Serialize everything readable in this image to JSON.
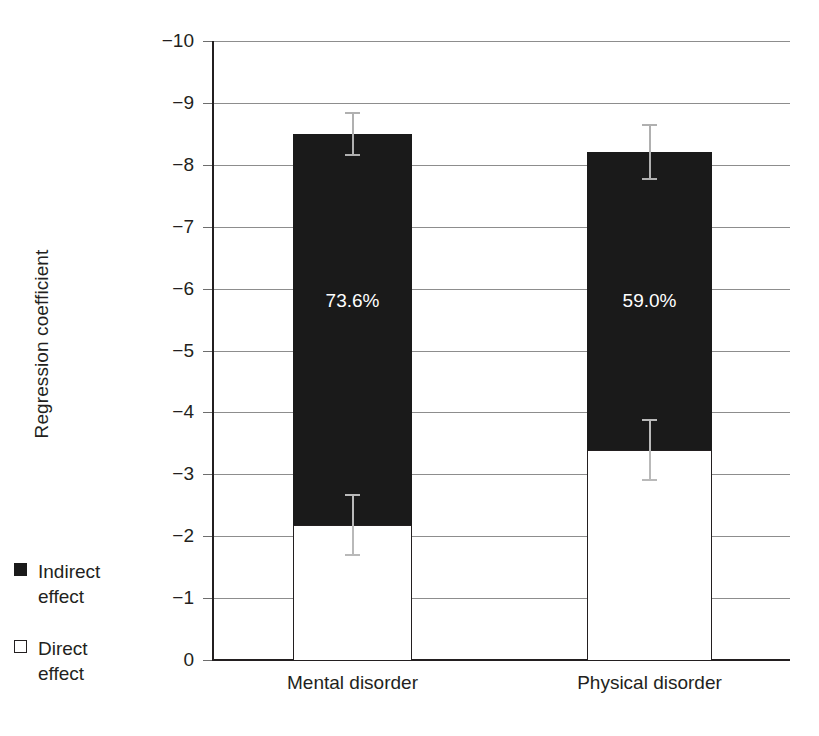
{
  "chart_data": {
    "type": "bar",
    "subtype": "stacked-bar-with-error-bars",
    "title": "",
    "xlabel": "",
    "ylabel": "Regression coefficient",
    "categories": [
      "Mental disorder",
      "Physical disorder"
    ],
    "ylim": [
      -10,
      0
    ],
    "y_tick_labels": [
      "−10",
      "−9",
      "−8",
      "−7",
      "−6",
      "−5",
      "−4",
      "−3",
      "−2",
      "−1",
      "0"
    ],
    "y_ticks": [
      -10,
      -9,
      -8,
      -7,
      -6,
      -5,
      -4,
      -3,
      -2,
      -1,
      0
    ],
    "grid": true,
    "grid_axis": "y",
    "legend_position": "left-outside",
    "series": [
      {
        "name": "Direct effect",
        "color": "#ffffff",
        "values": [
          -2.18,
          -3.39
        ],
        "error": [
          0.5,
          0.5
        ]
      },
      {
        "name": "Indirect effect",
        "color": "#1a1a1a",
        "values": [
          -6.32,
          -4.82
        ],
        "error": [
          0.0,
          0.0
        ]
      }
    ],
    "totals": [
      -8.5,
      -8.21
    ],
    "total_error": [
      0.35,
      0.45
    ],
    "data_labels": [
      "73.6%",
      "59.0%"
    ],
    "annotations": [
      {
        "text": "73.6%",
        "category": "Mental disorder",
        "meaning": "share of total effect that is indirect"
      },
      {
        "text": "59.0%",
        "category": "Physical disorder",
        "meaning": "share of total effect that is indirect"
      }
    ]
  },
  "axis": {
    "y_title": "Regression coefficient",
    "y_tick_labels": [
      "−10",
      "−9",
      "−8",
      "−7",
      "−6",
      "−5",
      "−4",
      "−3",
      "−2",
      "−1",
      "0"
    ]
  },
  "legend": {
    "items": [
      {
        "label_line1": "Indirect",
        "label_line2": "effect",
        "swatch": "filled-square",
        "color": "#1a1a1a"
      },
      {
        "label_line1": "Direct",
        "label_line2": "effect",
        "swatch": "hollow-square",
        "color": "#ffffff"
      }
    ]
  },
  "bars": [
    {
      "category": "Mental disorder",
      "total": -8.5,
      "direct": -2.18,
      "indirect": -6.32,
      "percent_label": "73.6%"
    },
    {
      "category": "Physical disorder",
      "total": -8.21,
      "direct": -3.39,
      "indirect": -4.82,
      "percent_label": "59.0%"
    }
  ],
  "colors": {
    "indirect": "#1a1a1a",
    "direct": "#ffffff",
    "grid": "#8d8d8d",
    "axis": "#231f20",
    "error_bar": "#b9b9b9"
  }
}
